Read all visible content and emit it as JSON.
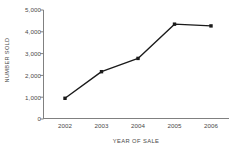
{
  "chart_data": {
    "type": "line",
    "title": "",
    "subtitle": "",
    "xlabel": "YEAR OF SALE",
    "ylabel": "NUMBER SOLD",
    "categories": [
      "2002",
      "2003",
      "2004",
      "2005",
      "2006"
    ],
    "values": [
      950,
      2170,
      2780,
      4350,
      4270
    ],
    "series": [
      {
        "name": "Number sold",
        "values": [
          950,
          2170,
          2780,
          4350,
          4270
        ]
      }
    ],
    "ylim": [
      0,
      5000
    ],
    "ytick_values": [
      0,
      1000,
      2000,
      3000,
      4000,
      5000
    ],
    "ytick_labels": [
      "0",
      "1,000",
      "2,000",
      "3,000",
      "4,000",
      "5,000"
    ],
    "xtick_labels": [
      "2002",
      "2003",
      "2004",
      "2005",
      "2006"
    ],
    "grid": false,
    "legend": "none",
    "marker": "square",
    "line_color": "#1a1a1a",
    "marker_color": "#1a1a1a",
    "axis_color": "#808080",
    "text_color": "#4a4a4a",
    "background": "#ffffff"
  }
}
